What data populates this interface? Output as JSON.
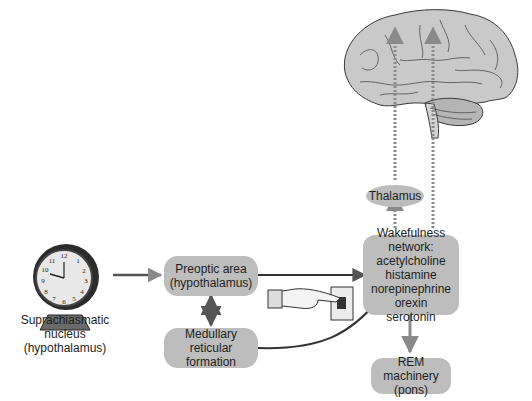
{
  "diagram": {
    "nodes": {
      "scn": {
        "line1": "Suprachiasmatic nucleus",
        "line2": "(hypothalamus)",
        "icon": "alarm-clock-icon"
      },
      "preoptic": {
        "line1": "Preoptic area",
        "line2": "(hypothalamus)"
      },
      "medullary": {
        "line1": "Medullary",
        "line2": "reticular formation"
      },
      "wakefulness": {
        "heading": "Wakefulness network:",
        "items": [
          "acetylcholine",
          "histamine",
          "norepinephrine",
          "orexin",
          "serotonin"
        ]
      },
      "thalamus": {
        "label": "Thalamus"
      },
      "rem": {
        "line1": "REM machinery",
        "line2": "(pons)"
      },
      "cortex": {
        "icon": "brain-icon"
      },
      "switch": {
        "icon": "hand-pressing-switch-icon"
      }
    },
    "edges": [
      {
        "from": "scn",
        "to": "preoptic",
        "style": "solid-arrow"
      },
      {
        "from": "preoptic",
        "to": "medullary",
        "style": "double-arrow"
      },
      {
        "from": "preoptic",
        "to": "wakefulness",
        "style": "solid-arrow"
      },
      {
        "from": "medullary",
        "to": "wakefulness",
        "style": "curved-arrow"
      },
      {
        "from": "wakefulness",
        "to": "thalamus",
        "style": "dashed-arrow"
      },
      {
        "from": "thalamus",
        "to": "cortex",
        "style": "dashed-arrow"
      },
      {
        "from": "wakefulness",
        "to": "cortex",
        "style": "dashed-arrow"
      },
      {
        "from": "wakefulness",
        "to": "rem",
        "style": "solid-arrow"
      }
    ],
    "colors": {
      "node_fill": "#bdbdbd",
      "arrow": "#555555",
      "dashed_arrow": "#8a8a8a",
      "brain_fill": "#c9c9c9"
    }
  }
}
